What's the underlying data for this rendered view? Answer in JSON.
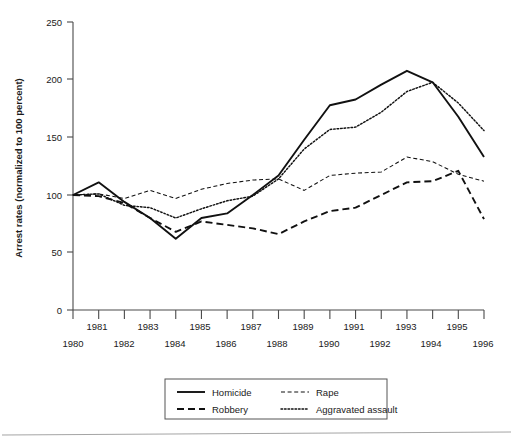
{
  "chart_data": {
    "type": "line",
    "title": "",
    "xlabel": "",
    "ylabel": "Arrest rates (normalized to 100 percent)",
    "xlim": [
      1980,
      1996
    ],
    "ylim": [
      0,
      250
    ],
    "yticks": [
      0,
      50,
      100,
      150,
      200,
      250
    ],
    "grid": false,
    "legend_position": "below-center",
    "x": [
      1980,
      1981,
      1982,
      1983,
      1984,
      1985,
      1986,
      1987,
      1988,
      1989,
      1990,
      1991,
      1992,
      1993,
      1994,
      1995,
      1996
    ],
    "x_tick_labels_upper": [
      "1981",
      "1983",
      "1985",
      "1987",
      "1989",
      "1991",
      "1993",
      "1995"
    ],
    "x_tick_labels_lower": [
      "1980",
      "1982",
      "1984",
      "1986",
      "1988",
      "1990",
      "1992",
      "1994",
      "1996"
    ],
    "series": [
      {
        "name": "Homicide",
        "style": "solid",
        "values": [
          100,
          111,
          94,
          80,
          62,
          80,
          84,
          100,
          117,
          148,
          178,
          183,
          196,
          208,
          198,
          168,
          133
        ]
      },
      {
        "name": "Robbery",
        "style": "dashed",
        "values": [
          100,
          99,
          93,
          80,
          68,
          77,
          74,
          71,
          66,
          77,
          86,
          89,
          100,
          111,
          112,
          121,
          79
        ]
      },
      {
        "name": "Rape",
        "style": "fine-dashed",
        "values": [
          100,
          101,
          97,
          104,
          97,
          105,
          110,
          113,
          114,
          104,
          117,
          119,
          120,
          133,
          129,
          118,
          112
        ]
      },
      {
        "name": "Aggravated assault",
        "style": "dotted",
        "values": [
          100,
          101,
          91,
          89,
          80,
          88,
          95,
          99,
          114,
          140,
          157,
          159,
          172,
          190,
          198,
          180,
          156
        ]
      }
    ]
  },
  "legend": {
    "entries": [
      {
        "label": "Homicide",
        "style": "solid"
      },
      {
        "label": "Rape",
        "style": "fine-dashed"
      },
      {
        "label": "Robbery",
        "style": "dashed"
      },
      {
        "label": "Aggravated assault",
        "style": "dotted"
      }
    ]
  },
  "colors": {
    "ink": "#111111",
    "axis": "#4a4a4a",
    "background": "#ffffff",
    "rule": "#9a9a9a"
  }
}
